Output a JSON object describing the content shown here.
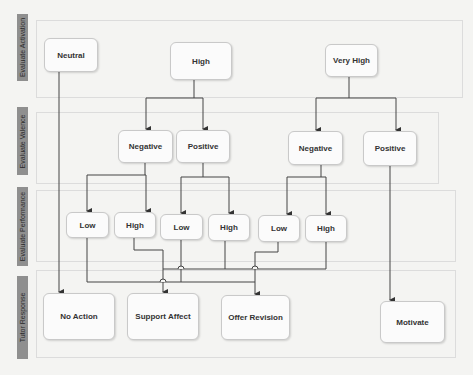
{
  "lanes": [
    {
      "label": "Evaluate Activation"
    },
    {
      "label": "Evaluate Valence"
    },
    {
      "label": "Evaluate Performance"
    },
    {
      "label": "Tutor Response"
    }
  ],
  "nodes": {
    "activation": {
      "neutral": "Neutral",
      "high": "High",
      "very_high": "Very High"
    },
    "valence": {
      "high_negative": "Negative",
      "high_positive": "Positive",
      "veryhigh_negative": "Negative",
      "veryhigh_positive": "Positive"
    },
    "performance": {
      "hn_low": "Low",
      "hn_high": "High",
      "hp_low": "Low",
      "hp_high": "High",
      "vhn_low": "Low",
      "vhn_high": "High"
    },
    "response": {
      "no_action": "No Action",
      "support_affect": "Support Affect",
      "offer_revision": "Offer Revision",
      "motivate": "Motivate"
    }
  },
  "edges": [
    {
      "from": "Neutral",
      "to": "No Action"
    },
    {
      "from": "High",
      "to": "Negative (High)"
    },
    {
      "from": "High",
      "to": "Positive (High)"
    },
    {
      "from": "Very High",
      "to": "Negative (Very High)"
    },
    {
      "from": "Very High",
      "to": "Positive (Very High)"
    },
    {
      "from": "Negative (High)",
      "to": "Low"
    },
    {
      "from": "Negative (High)",
      "to": "High"
    },
    {
      "from": "Positive (High)",
      "to": "Low"
    },
    {
      "from": "Positive (High)",
      "to": "High"
    },
    {
      "from": "Negative (Very High)",
      "to": "Low"
    },
    {
      "from": "Negative (Very High)",
      "to": "High"
    },
    {
      "from": "Positive (Very High)",
      "to": "Motivate"
    },
    {
      "from": "Low (Negative, High)",
      "to": "Offer Revision"
    },
    {
      "from": "High (Negative, High)",
      "to": "Support Affect"
    },
    {
      "from": "Low (Positive, High)",
      "to": "Offer Revision"
    },
    {
      "from": "High (Positive, High)",
      "to": "Support Affect"
    },
    {
      "from": "Low (Negative, Very High)",
      "to": "Offer Revision"
    },
    {
      "from": "High (Negative, Very High)",
      "to": "Support Affect"
    }
  ]
}
